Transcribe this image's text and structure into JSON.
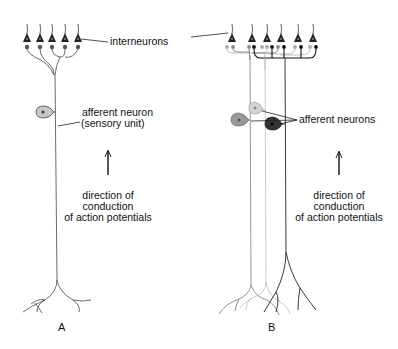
{
  "panel_a": {
    "label": "A",
    "interneurons_label": "interneurons",
    "afferent_label_line1": "afferent neuron",
    "afferent_label_line2": "(sensory unit)",
    "direction_line1": "direction of",
    "direction_line2": "conduction",
    "direction_line3": "of action potentials"
  },
  "panel_b": {
    "label": "B",
    "afferent_label": "afferent neurons",
    "direction_line1": "direction of",
    "direction_line2": "conduction",
    "direction_line3": "of action potentials"
  },
  "colors": {
    "ink": "#111111",
    "light_neuron": "#bdbdbd",
    "medium_neuron": "#8a8a8a",
    "dark_neuron": "#222222"
  }
}
